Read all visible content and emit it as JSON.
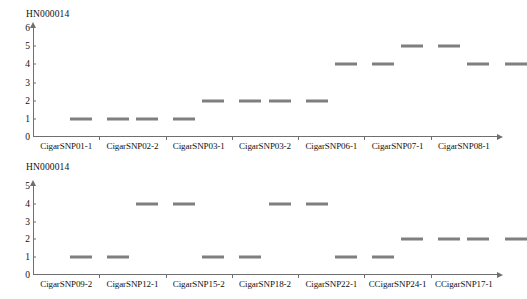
{
  "chart_data": [
    {
      "id": "top",
      "type": "scatter",
      "title": "HN000014",
      "xlabel": "",
      "ylabel": "",
      "ylim": [
        0,
        6
      ],
      "yticks": [
        "0",
        "1",
        "2",
        "3",
        "4",
        "5",
        "6"
      ],
      "grid": false,
      "legend": "none",
      "categories": [
        "CigarSNP01-1",
        "CigarSNP02-2",
        "CigarSNP03-1",
        "CigarSNP03-2",
        "CigarSNP06-1",
        "CigarSNP07-1",
        "CigarSNP08-1"
      ],
      "series": [
        {
          "name": "marker-a",
          "values": [
            1,
            1,
            2,
            2,
            4,
            5,
            4
          ]
        },
        {
          "name": "marker-b",
          "values": [
            1,
            1,
            2,
            2,
            4,
            5,
            4
          ]
        }
      ],
      "points": [
        {
          "x": 0.72,
          "y": 1
        },
        {
          "x": 1.28,
          "y": 1
        },
        {
          "x": 1.72,
          "y": 1
        },
        {
          "x": 2.28,
          "y": 1
        },
        {
          "x": 2.72,
          "y": 2
        },
        {
          "x": 3.28,
          "y": 2
        },
        {
          "x": 3.72,
          "y": 2
        },
        {
          "x": 4.28,
          "y": 2
        },
        {
          "x": 4.72,
          "y": 4
        },
        {
          "x": 5.28,
          "y": 4
        },
        {
          "x": 5.72,
          "y": 5
        },
        {
          "x": 6.28,
          "y": 5
        },
        {
          "x": 6.72,
          "y": 4
        },
        {
          "x": 7.28,
          "y": 4
        }
      ]
    },
    {
      "id": "bottom",
      "type": "scatter",
      "title": "HN000014",
      "xlabel": "",
      "ylabel": "",
      "ylim": [
        0,
        5
      ],
      "yticks": [
        "0",
        "1",
        "2",
        "3",
        "4",
        "5"
      ],
      "grid": false,
      "legend": "none",
      "categories": [
        "CigarSNP09-2",
        "CigarSNP12-1",
        "CigarSNP15-2",
        "CigarSNP18-2",
        "CigarSNP22-1",
        "CCigarSNP24-1",
        "CCigarSNP17-1"
      ],
      "series": [
        {
          "name": "marker-a",
          "values": [
            1,
            4,
            1,
            4,
            1,
            2,
            2
          ]
        },
        {
          "name": "marker-b",
          "values": [
            1,
            4,
            1,
            4,
            1,
            2,
            2
          ]
        }
      ],
      "points": [
        {
          "x": 0.72,
          "y": 1
        },
        {
          "x": 1.28,
          "y": 1
        },
        {
          "x": 1.72,
          "y": 4
        },
        {
          "x": 2.28,
          "y": 4
        },
        {
          "x": 2.72,
          "y": 1
        },
        {
          "x": 3.28,
          "y": 1
        },
        {
          "x": 3.72,
          "y": 4
        },
        {
          "x": 4.28,
          "y": 4
        },
        {
          "x": 4.72,
          "y": 1
        },
        {
          "x": 5.28,
          "y": 1
        },
        {
          "x": 5.72,
          "y": 2
        },
        {
          "x": 6.28,
          "y": 2
        },
        {
          "x": 6.72,
          "y": 2
        },
        {
          "x": 7.28,
          "y": 2
        }
      ]
    }
  ],
  "style": {
    "marker_color": "#7f7f7f",
    "axis_color": "#6f6f6f",
    "text_color": "#111111",
    "background": "#ffffff"
  }
}
